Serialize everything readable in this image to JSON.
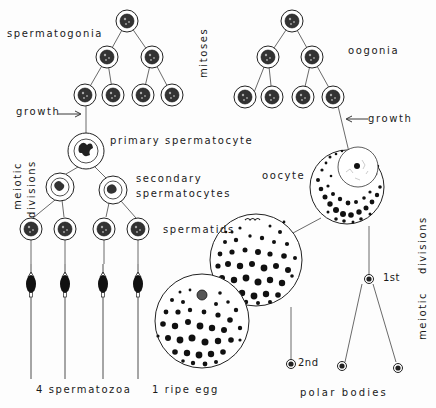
{
  "diagram": {
    "male": {
      "labels": {
        "spermatogonia": "spermatogonia",
        "growth": "growth",
        "primary": "primary spermatocyte",
        "secondary_1": "secondary",
        "secondary_2": "spermatocytes",
        "spermatids": "spermatids",
        "meiotic": "meiotic",
        "divisions": "divisions",
        "result": "4 spermatozoa"
      }
    },
    "center": {
      "mitoses": "mitoses"
    },
    "female": {
      "labels": {
        "oogonia": "oogonia",
        "growth": "growth",
        "oocyte": "oocyte",
        "first": "1st",
        "second": "2nd",
        "meiotic": "meiotic",
        "divisions": "divisions",
        "ripe_egg": "1 ripe egg",
        "polar_bodies": "polar bodies"
      }
    },
    "colors": {
      "ink": "#1a1a1a",
      "background": "#fdfdfd"
    }
  }
}
